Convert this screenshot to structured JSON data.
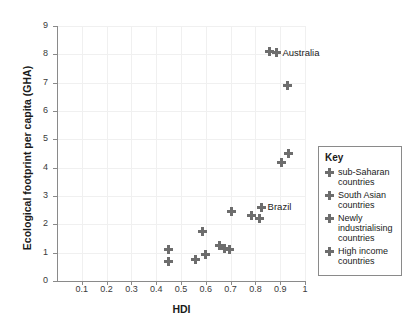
{
  "chart_data": {
    "type": "scatter",
    "title": "",
    "xlabel": "HDI",
    "ylabel": "Ecological footprint per capita (GHA)",
    "xlim": [
      0,
      1
    ],
    "ylim": [
      0,
      9
    ],
    "xticks": [
      "0.1",
      "0.2",
      "0.3",
      "0.4",
      "0.5",
      "0.6",
      "0.7",
      "0.8",
      "0.9",
      "1"
    ],
    "xtick_values": [
      0.1,
      0.2,
      0.3,
      0.4,
      0.5,
      0.6,
      0.7,
      0.8,
      0.9,
      1.0
    ],
    "yticks": [
      "0",
      "1",
      "2",
      "3",
      "4",
      "5",
      "6",
      "7",
      "8",
      "9"
    ],
    "ytick_values": [
      0,
      1,
      2,
      3,
      4,
      5,
      6,
      7,
      8,
      9
    ],
    "grid": true,
    "legend_position": "right",
    "marker": "plus",
    "marker_color": "#6d6d6d",
    "series": [
      {
        "name": "sub-Saharan countries",
        "points": [
          {
            "x": 0.45,
            "y": 1.1
          },
          {
            "x": 0.45,
            "y": 0.7
          },
          {
            "x": 0.56,
            "y": 0.75
          }
        ]
      },
      {
        "name": "South Asian countries",
        "points": [
          {
            "x": 0.6,
            "y": 0.95
          },
          {
            "x": 0.655,
            "y": 1.25
          },
          {
            "x": 0.675,
            "y": 1.15
          },
          {
            "x": 0.695,
            "y": 1.1
          }
        ]
      },
      {
        "name": "Newly industrialising countries",
        "points": [
          {
            "x": 0.585,
            "y": 1.75
          },
          {
            "x": 0.705,
            "y": 2.45
          },
          {
            "x": 0.785,
            "y": 2.3
          },
          {
            "x": 0.815,
            "y": 2.2
          },
          {
            "x": 0.825,
            "y": 2.6,
            "label": "Brazil"
          }
        ]
      },
      {
        "name": "High income countries",
        "points": [
          {
            "x": 0.855,
            "y": 8.1
          },
          {
            "x": 0.885,
            "y": 8.05,
            "label": "Australia"
          },
          {
            "x": 0.93,
            "y": 6.9
          },
          {
            "x": 0.905,
            "y": 4.2
          },
          {
            "x": 0.935,
            "y": 4.5
          }
        ]
      }
    ],
    "annotations": [
      {
        "text": "Australia",
        "x": 0.885,
        "y": 8.05
      },
      {
        "text": "Brazil",
        "x": 0.825,
        "y": 2.6
      }
    ]
  },
  "legend": {
    "title": "Key",
    "items": [
      {
        "label": "sub-Saharan countries"
      },
      {
        "label": "South Asian countries"
      },
      {
        "label": "Newly industrialising countries"
      },
      {
        "label": "High income countries"
      }
    ]
  }
}
